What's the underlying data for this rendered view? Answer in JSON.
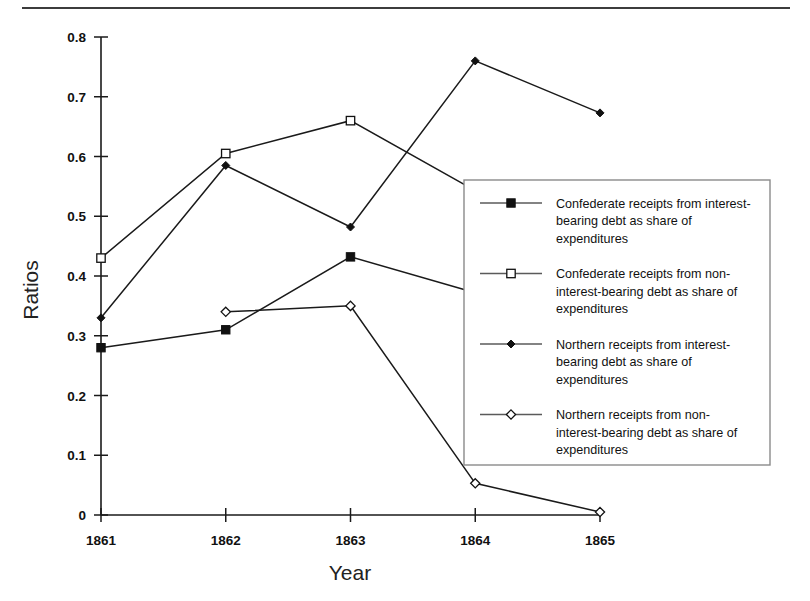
{
  "figure": {
    "has_top_rule": true,
    "background_color": "#ffffff",
    "line_color": "#1a1a1a"
  },
  "chart_data": {
    "type": "line",
    "title": "",
    "xlabel": "Year",
    "ylabel": "Ratios",
    "categories": [
      "1861",
      "1862",
      "1863",
      "1864",
      "1865"
    ],
    "x": [
      1861,
      1862,
      1863,
      1864,
      1865
    ],
    "xlim": [
      1861,
      1865
    ],
    "ylim": [
      0,
      0.8
    ],
    "ytick_labels": [
      "0",
      "0.1",
      "0.2",
      "0.3",
      "0.4",
      "0.5",
      "0.6",
      "0.7",
      "0.8"
    ],
    "ytick_values": [
      0,
      0.1,
      0.2,
      0.3,
      0.4,
      0.5,
      0.6,
      0.7,
      0.8
    ],
    "xtick_labels": [
      "1861",
      "1862",
      "1863",
      "1864",
      "1865"
    ],
    "grid": false,
    "legend_position": "center-right",
    "series": [
      {
        "name": "Confederate receipts from interest-bearing debt as share of expenditures",
        "marker": "filled-square",
        "values": [
          0.28,
          0.31,
          0.432,
          0.372,
          null
        ]
      },
      {
        "name": "Confederate receipts from non-interest-bearing debt as share of expenditures",
        "marker": "open-square",
        "values": [
          0.43,
          0.605,
          0.66,
          0.543,
          null
        ]
      },
      {
        "name": "Northern receipts from interest-bearing debt as share of expenditures",
        "marker": "filled-diamond",
        "values": [
          0.33,
          0.585,
          0.482,
          0.76,
          0.673
        ]
      },
      {
        "name": "Northern receipts from non-interest-bearing debt as share of expenditures",
        "marker": "open-diamond",
        "values": [
          null,
          0.34,
          0.35,
          0.053,
          0.005
        ]
      }
    ]
  },
  "legend": {
    "entries": [
      {
        "marker": "filled-square",
        "lines": [
          "Confederate receipts from interest-",
          "bearing debt as share of",
          "expenditures"
        ]
      },
      {
        "marker": "open-square",
        "lines": [
          "Confederate receipts from non-",
          "interest-bearing debt as share of",
          "expenditures"
        ]
      },
      {
        "marker": "filled-diamond",
        "lines": [
          "Northern receipts from interest-",
          "bearing debt as share of",
          "expenditures"
        ]
      },
      {
        "marker": "open-diamond",
        "lines": [
          "Northern receipts from non-",
          "interest-bearing debt as share of",
          "expenditures"
        ]
      }
    ]
  }
}
